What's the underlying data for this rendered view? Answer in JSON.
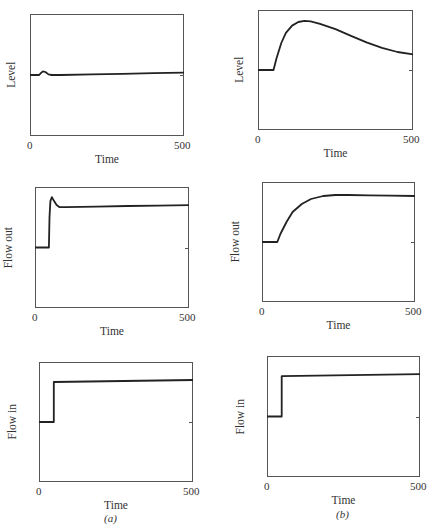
{
  "captions": {
    "a": "(a)",
    "b": "(b)"
  },
  "chart_data": [
    {
      "id": "a-level",
      "column": "a",
      "type": "line",
      "title": "",
      "xlabel": "Time",
      "ylabel": "Level",
      "xlim": [
        0,
        500
      ],
      "ylim": [
        0,
        2
      ],
      "xticks": [
        "0",
        "500"
      ],
      "yticks": [
        "0",
        "1",
        "2"
      ],
      "grid": false,
      "series": [
        {
          "name": "Level",
          "x": [
            0,
            30,
            35,
            42,
            50,
            60,
            70,
            100,
            200,
            300,
            400,
            500
          ],
          "y": [
            1.0,
            1.0,
            1.03,
            1.06,
            1.05,
            1.01,
            1.0,
            1.0,
            1.01,
            1.02,
            1.03,
            1.04
          ]
        }
      ]
    },
    {
      "id": "b-level",
      "column": "b",
      "type": "line",
      "title": "",
      "xlabel": "Time",
      "ylabel": "Level",
      "xlim": [
        0,
        500
      ],
      "ylim": [
        0,
        2
      ],
      "xticks": [
        "0",
        "500"
      ],
      "yticks": [
        "0",
        "1",
        "2"
      ],
      "grid": false,
      "series": [
        {
          "name": "Level",
          "x": [
            0,
            50,
            60,
            75,
            90,
            110,
            130,
            150,
            170,
            200,
            250,
            300,
            350,
            400,
            450,
            500
          ],
          "y": [
            1.0,
            1.0,
            1.2,
            1.45,
            1.62,
            1.74,
            1.8,
            1.82,
            1.81,
            1.77,
            1.68,
            1.57,
            1.46,
            1.37,
            1.3,
            1.26
          ]
        }
      ]
    },
    {
      "id": "a-flow-out",
      "column": "a",
      "type": "line",
      "title": "",
      "xlabel": "Time",
      "ylabel": "Flow out",
      "xlim": [
        0,
        500
      ],
      "ylim": [
        1.7,
        2.3
      ],
      "xticks": [
        "0",
        "500"
      ],
      "yticks": [
        "1.7",
        "2",
        "2.3"
      ],
      "grid": false,
      "series": [
        {
          "name": "Flow out",
          "x": [
            0,
            45,
            47,
            50,
            55,
            62,
            70,
            80,
            100,
            200,
            300,
            400,
            500
          ],
          "y": [
            2.0,
            2.0,
            2.15,
            2.23,
            2.25,
            2.23,
            2.21,
            2.2,
            2.2,
            2.203,
            2.206,
            2.208,
            2.21
          ]
        }
      ]
    },
    {
      "id": "b-flow-out",
      "column": "b",
      "type": "line",
      "title": "",
      "xlabel": "Time",
      "ylabel": "Flow out",
      "xlim": [
        0,
        500
      ],
      "ylim": [
        1.7,
        2.3
      ],
      "xticks": [
        "0",
        "500"
      ],
      "yticks": [
        "1.7",
        "2",
        "2.3"
      ],
      "grid": false,
      "series": [
        {
          "name": "Flow out",
          "x": [
            0,
            50,
            60,
            80,
            100,
            130,
            160,
            200,
            240,
            280,
            350,
            420,
            500
          ],
          "y": [
            2.0,
            2.0,
            2.04,
            2.1,
            2.15,
            2.19,
            2.215,
            2.23,
            2.235,
            2.235,
            2.233,
            2.232,
            2.23
          ]
        }
      ]
    },
    {
      "id": "a-flow-in",
      "column": "a",
      "type": "line",
      "title": "",
      "xlabel": "Time",
      "ylabel": "Flow in",
      "xlim": [
        0,
        500
      ],
      "ylim": [
        1.7,
        2.3
      ],
      "xticks": [
        "0",
        "500"
      ],
      "yticks": [
        "1.7",
        "2",
        "2.3"
      ],
      "grid": false,
      "series": [
        {
          "name": "Flow in",
          "x": [
            0,
            48,
            48,
            500
          ],
          "y": [
            2.0,
            2.0,
            2.2,
            2.21
          ]
        }
      ]
    },
    {
      "id": "b-flow-in",
      "column": "b",
      "type": "line",
      "title": "",
      "xlabel": "Time",
      "ylabel": "Flow in",
      "xlim": [
        0,
        500
      ],
      "ylim": [
        1.7,
        2.3
      ],
      "xticks": [
        "0",
        "500"
      ],
      "yticks": [
        "1.7",
        "2",
        "2.3"
      ],
      "grid": false,
      "series": [
        {
          "name": "Flow in",
          "x": [
            0,
            48,
            48,
            500
          ],
          "y": [
            2.0,
            2.0,
            2.2,
            2.21
          ]
        }
      ]
    }
  ]
}
